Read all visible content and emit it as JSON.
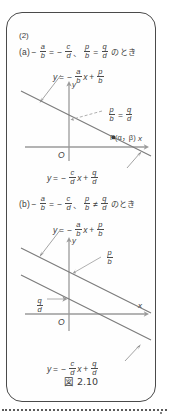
{
  "figure": {
    "caption": "図 2.10",
    "problem_number": "(2)",
    "cases": [
      {
        "tag": "(a)",
        "condition_parts": {
          "minus1": "−",
          "frac_ab": {
            "num": "a",
            "den": "b"
          },
          "equals": "=",
          "minus2": "−",
          "frac_cd": {
            "num": "c",
            "den": "d"
          },
          "comma": "、",
          "frac_pb": {
            "num": "p",
            "den": "b"
          },
          "relation": "=",
          "frac_qd": {
            "num": "q",
            "den": "d"
          },
          "suffix": "のとき"
        },
        "diagram": {
          "line1_label": {
            "y": "y",
            "eq": "=",
            "minus": "−",
            "frac": {
              "num": "a",
              "den": "b"
            },
            "x": "x",
            "plus": "+",
            "frac2": {
              "num": "p",
              "den": "b"
            }
          },
          "line2_label": {
            "y": "y",
            "eq": "=",
            "minus": "−",
            "frac": {
              "num": "c",
              "den": "d"
            },
            "x": "x",
            "plus": "+",
            "frac2": {
              "num": "q",
              "den": "d"
            }
          },
          "intercept_label": {
            "frac1": {
              "num": "p",
              "den": "b"
            },
            "equals": "=",
            "frac2": {
              "num": "q",
              "den": "d"
            }
          },
          "point_label": "P(α，β)",
          "axis_x": "x",
          "axis_y": "y",
          "origin": "O"
        }
      },
      {
        "tag": "(b)",
        "condition_parts": {
          "minus1": "−",
          "frac_ab": {
            "num": "a",
            "den": "b"
          },
          "equals": "=",
          "minus2": "−",
          "frac_cd": {
            "num": "c",
            "den": "d"
          },
          "comma": "、",
          "frac_pb": {
            "num": "p",
            "den": "b"
          },
          "relation": "≠",
          "frac_qd": {
            "num": "q",
            "den": "d"
          },
          "suffix": "のとき"
        },
        "diagram": {
          "line1_label": {
            "y": "y",
            "eq": "=",
            "minus": "−",
            "frac": {
              "num": "a",
              "den": "b"
            },
            "x": "x",
            "plus": "+",
            "frac2": {
              "num": "p",
              "den": "b"
            }
          },
          "line2_label": {
            "y": "y",
            "eq": "=",
            "minus": "−",
            "frac": {
              "num": "c",
              "den": "d"
            },
            "x": "x",
            "plus": "+",
            "frac2": {
              "num": "q",
              "den": "d"
            }
          },
          "intercept_pb": {
            "num": "p",
            "den": "b"
          },
          "intercept_qd": {
            "num": "q",
            "den": "d"
          },
          "axis_x": "x",
          "axis_y": "y",
          "origin": "O"
        }
      }
    ]
  },
  "colors": {
    "ink": "#3d3d3d",
    "border": "#4a4a4a",
    "axis": "#8c8c8c",
    "line": "#6e6e6e",
    "background": "#ffffff"
  }
}
